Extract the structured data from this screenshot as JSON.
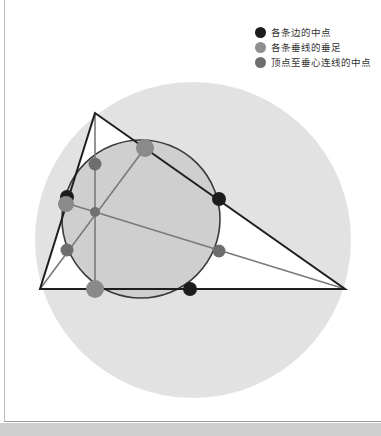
{
  "legend": {
    "items": [
      {
        "label": "各条边的中点",
        "color": "#1c1c1c"
      },
      {
        "label": "各条垂线的垂足",
        "color": "#8f8f8f"
      },
      {
        "label": "顶点至垂心连线的中点",
        "color": "#6e6e6e"
      }
    ]
  },
  "figure": {
    "circumcircle": {
      "cx": 193,
      "cy": 240,
      "r": 158,
      "fill": "#e2e2e2"
    },
    "nine_point_circle": {
      "cx": 141,
      "cy": 219,
      "r": 79,
      "fill": "#cfcfcf",
      "stroke": "#3a3a3a"
    },
    "triangle": {
      "A": [
        95,
        113
      ],
      "B": [
        40,
        289
      ],
      "C": [
        345,
        289
      ],
      "fill": "#ffffff",
      "stroke": "#1e1e1e"
    },
    "orthocenter": [
      95,
      212
    ],
    "altitude_color": "#7a7a7a",
    "points": {
      "midpoints_of_sides": [
        [
          67,
          199
        ],
        [
          219,
          199
        ],
        [
          190,
          289
        ]
      ],
      "feet_of_altitudes": [
        [
          95,
          289
        ],
        [
          145,
          148
        ],
        [
          66,
          203
        ]
      ],
      "vertex_orthocenter_midpoints": [
        [
          95,
          163
        ],
        [
          67,
          250
        ],
        [
          219,
          251
        ]
      ]
    }
  }
}
